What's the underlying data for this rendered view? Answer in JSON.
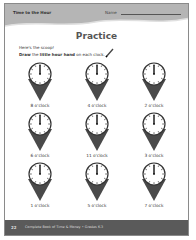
{
  "header": {
    "section_title": "Time to the Hour",
    "name_label": "Name"
  },
  "page": {
    "title": "Practice",
    "intro": "Here's the scoop!",
    "instruction_parts": [
      "Draw",
      " the ",
      "little hour hand",
      " on each clock."
    ]
  },
  "clocks": [
    {
      "label": "8 o'clock"
    },
    {
      "label": "4 o'clock"
    },
    {
      "label": "2 o'clock"
    },
    {
      "label": "6 o'clock"
    },
    {
      "label": "11 o'clock"
    },
    {
      "label": "3 o'clock"
    },
    {
      "label": "1 o'clock"
    },
    {
      "label": "5 o'clock"
    },
    {
      "label": "7 o'clock"
    }
  ],
  "footer": {
    "page_number": "22",
    "book_title": "Complete Book of Time & Money • Grades K-3"
  },
  "colors": {
    "header_band": "#b5b5b5",
    "footer_band": "#5a5a5a",
    "cone": "#4a4a4a"
  }
}
